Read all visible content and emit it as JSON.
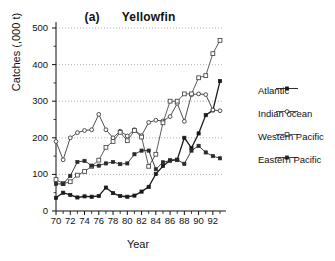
{
  "chart_data": {
    "type": "line",
    "title": "Yellowfin",
    "panel_tag": "(a)",
    "xlabel": "Year",
    "ylabel": "Catches (,000 t)",
    "xlim": [
      70,
      93
    ],
    "ylim": [
      0,
      500
    ],
    "yticks": [
      0,
      100,
      200,
      300,
      400,
      500
    ],
    "xticks": [
      70,
      72,
      74,
      76,
      78,
      80,
      82,
      84,
      86,
      88,
      90,
      92
    ],
    "x_minor_step": 1,
    "grid": "horizontal-dotted",
    "legend_position": "right",
    "x": [
      70,
      71,
      72,
      73,
      74,
      75,
      76,
      77,
      78,
      79,
      80,
      81,
      82,
      83,
      84,
      85,
      86,
      87,
      88,
      89,
      90,
      91,
      92,
      93
    ],
    "series": [
      {
        "name": "Atlantic",
        "marker": "filled-square",
        "color": "#1a1a1a",
        "values": [
          36,
          50,
          44,
          37,
          40,
          39,
          41,
          64,
          49,
          41,
          39,
          42,
          53,
          66,
          101,
          123,
          138,
          140,
          200,
          172,
          212,
          262,
          275,
          355
        ]
      },
      {
        "name": "Indian ocean",
        "marker": "open-circle",
        "color": "#3a3a3a",
        "values": [
          190,
          140,
          200,
          214,
          220,
          222,
          264,
          222,
          200,
          218,
          205,
          222,
          206,
          242,
          248,
          246,
          258,
          294,
          245,
          318,
          320,
          318,
          276,
          274
        ]
      },
      {
        "name": "Western Pacific",
        "marker": "open-square",
        "color": "#4a4a4a",
        "values": [
          86,
          75,
          80,
          98,
          108,
          122,
          139,
          174,
          190,
          215,
          192,
          220,
          202,
          122,
          155,
          241,
          300,
          300,
          320,
          320,
          364,
          370,
          430,
          466
        ]
      },
      {
        "name": "Eastern Pacific",
        "marker": "filled-square",
        "color": "#2a2a2a",
        "values": [
          74,
          74,
          96,
          134,
          137,
          124,
          124,
          130,
          134,
          128,
          130,
          155,
          165,
          165,
          114,
          133,
          138,
          140,
          129,
          165,
          178,
          160,
          150,
          144
        ]
      }
    ]
  },
  "legend": {
    "items": [
      {
        "label": "Atlantic"
      },
      {
        "label": "Indian ocean"
      },
      {
        "label": "Western Pacific"
      },
      {
        "label": "Eastern Pacific"
      }
    ]
  }
}
